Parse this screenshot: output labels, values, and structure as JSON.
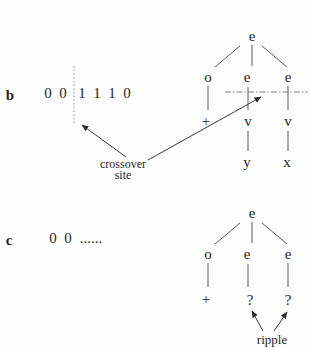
{
  "figure": {
    "panel_b": {
      "label": "b",
      "bitstring": [
        "0",
        "0",
        "1",
        "1",
        "1",
        "0"
      ],
      "crossover_label": {
        "line1": "crossover",
        "line2": "site"
      },
      "tree": {
        "root": "e",
        "level2": [
          "o",
          "e",
          "e"
        ],
        "level3": [
          "+",
          "v",
          "v"
        ],
        "level4": [
          "y",
          "x"
        ]
      }
    },
    "panel_c": {
      "label": "c",
      "bitstring": [
        "0",
        "0"
      ],
      "ellipsis": "......",
      "ripple_label": "ripple",
      "tree": {
        "root": "e",
        "level2": [
          "o",
          "e",
          "e"
        ],
        "level3": [
          "+",
          "?",
          "?"
        ]
      }
    },
    "colors": {
      "ink": "#262626",
      "edge": "#5a5a5a",
      "arrow": "#3a3a3a",
      "dotted": "#8a8a8a",
      "background": "#fefefe"
    }
  }
}
